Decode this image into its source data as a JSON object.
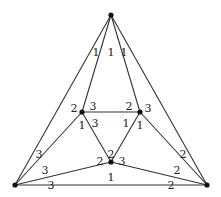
{
  "diagram": {
    "type": "graph",
    "colors": {
      "edge": "#333333",
      "node": "#111111",
      "label": "#222222"
    },
    "nodes": [
      {
        "id": "top",
        "x": 111,
        "y": 15
      },
      {
        "id": "inner-left",
        "x": 82,
        "y": 112
      },
      {
        "id": "inner-right",
        "x": 140,
        "y": 112
      },
      {
        "id": "inner-bottom",
        "x": 111,
        "y": 162
      },
      {
        "id": "outer-left",
        "x": 15,
        "y": 185
      },
      {
        "id": "outer-right",
        "x": 207,
        "y": 185
      }
    ],
    "edges": [
      {
        "from": "top",
        "to": "outer-left"
      },
      {
        "from": "top",
        "to": "inner-left"
      },
      {
        "from": "top",
        "to": "inner-right"
      },
      {
        "from": "top",
        "to": "outer-right"
      },
      {
        "from": "inner-left",
        "to": "inner-right"
      },
      {
        "from": "inner-left",
        "to": "inner-bottom"
      },
      {
        "from": "inner-right",
        "to": "inner-bottom"
      },
      {
        "from": "inner-left",
        "to": "outer-left"
      },
      {
        "from": "inner-right",
        "to": "outer-right"
      },
      {
        "from": "inner-bottom",
        "to": "outer-left"
      },
      {
        "from": "inner-bottom",
        "to": "outer-right"
      },
      {
        "from": "outer-left",
        "to": "outer-right"
      }
    ],
    "labels": [
      {
        "text": "1",
        "x": 96,
        "y": 53
      },
      {
        "text": "1",
        "x": 111,
        "y": 53
      },
      {
        "text": "1",
        "x": 124,
        "y": 53
      },
      {
        "text": "2",
        "x": 74,
        "y": 109
      },
      {
        "text": "3",
        "x": 93,
        "y": 107
      },
      {
        "text": "2",
        "x": 129,
        "y": 107
      },
      {
        "text": "3",
        "x": 148,
        "y": 109
      },
      {
        "text": "1",
        "x": 82,
        "y": 126
      },
      {
        "text": "3",
        "x": 95,
        "y": 124
      },
      {
        "text": "1",
        "x": 126,
        "y": 124
      },
      {
        "text": "1",
        "x": 140,
        "y": 126
      },
      {
        "text": "2",
        "x": 111,
        "y": 155
      },
      {
        "text": "2",
        "x": 100,
        "y": 162
      },
      {
        "text": "3",
        "x": 122,
        "y": 162
      },
      {
        "text": "1",
        "x": 111,
        "y": 178
      },
      {
        "text": "3",
        "x": 39,
        "y": 155
      },
      {
        "text": "3",
        "x": 45,
        "y": 171
      },
      {
        "text": "3",
        "x": 51,
        "y": 186
      },
      {
        "text": "2",
        "x": 183,
        "y": 155
      },
      {
        "text": "2",
        "x": 177,
        "y": 171
      },
      {
        "text": "2",
        "x": 171,
        "y": 186
      }
    ]
  }
}
